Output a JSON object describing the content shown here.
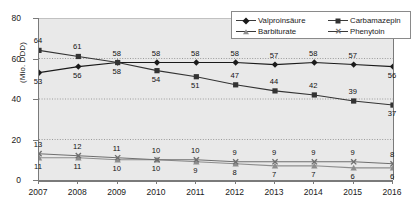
{
  "chart_data": {
    "type": "line",
    "title": "",
    "xlabel": "",
    "ylabel": "(Mio. DDD)",
    "ylim": [
      0,
      80
    ],
    "yticks": [
      0,
      20,
      40,
      60,
      80
    ],
    "grid": true,
    "legend_position": "top-right",
    "categories": [
      "2007",
      "2008",
      "2009",
      "2010",
      "2011",
      "2012",
      "2013",
      "2014",
      "2015",
      "2016"
    ],
    "series": [
      {
        "name": "Valproinsäure",
        "marker": "diamond",
        "label_side": "above",
        "values": [
          53,
          56,
          58,
          58,
          58,
          58,
          57,
          58,
          57,
          56
        ]
      },
      {
        "name": "Carbamazepin",
        "marker": "square",
        "label_side": "above",
        "values": [
          64,
          61,
          58,
          54,
          51,
          47,
          44,
          42,
          39,
          37
        ]
      },
      {
        "name": "Barbiturate",
        "marker": "triangle",
        "label_side": "below",
        "values": [
          11,
          11,
          10,
          10,
          9,
          8,
          7,
          7,
          6,
          6
        ]
      },
      {
        "name": "Phenytoin",
        "marker": "x",
        "label_side": "above",
        "values": [
          13,
          12,
          11,
          10,
          10,
          9,
          9,
          9,
          9,
          8
        ]
      }
    ],
    "label_overrides": {
      "Valproinsäure": [
        "below",
        "below",
        "below",
        "above",
        "above",
        "above",
        "above",
        "above",
        "above",
        "below"
      ],
      "Carbamazepin": [
        "above",
        "above",
        "above",
        "below",
        "below",
        "above",
        "above",
        "above",
        "above",
        "below"
      ]
    },
    "colors": {
      "plot_background": "#e9e9e9",
      "axis": "#7a7a7a",
      "gridline": "#9a9a9a",
      "valproinsaure": "#1a1a1a",
      "carbamazepin": "#333333",
      "barbiturate": "#8d8d8d",
      "phenytoin": "#6f6f6f"
    }
  }
}
